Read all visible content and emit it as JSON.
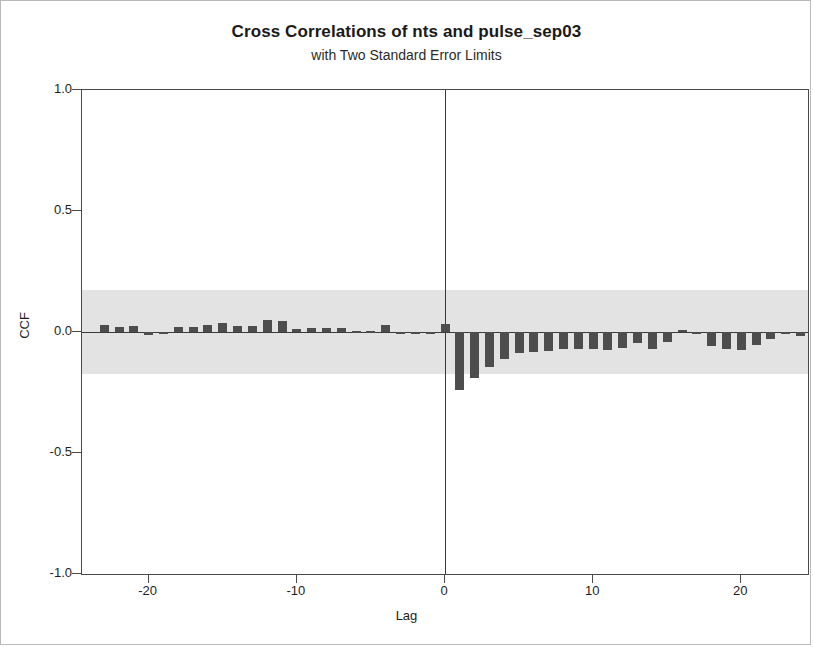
{
  "chart_data": {
    "type": "bar",
    "title": "Cross Correlations of nts and pulse_sep03",
    "subtitle": "with Two Standard Error Limits",
    "xlabel": "Lag",
    "ylabel": "CCF",
    "xlim": [
      -24.5,
      24.5
    ],
    "ylim": [
      -1.0,
      1.0
    ],
    "grid": false,
    "legend": null,
    "y_ticks": [
      "1.0",
      "0.5",
      "0.0",
      "-0.5",
      "-1.0"
    ],
    "y_tick_values": [
      1.0,
      0.5,
      0.0,
      -0.5,
      -1.0
    ],
    "x_ticks": [
      "-20",
      "-10",
      "0",
      "10",
      "20"
    ],
    "x_tick_values": [
      -20,
      -10,
      0,
      10,
      20
    ],
    "significance_band": {
      "label": "Two Standard Error Limits",
      "upper": 0.173,
      "lower": -0.173,
      "color": "#e3e3e3",
      "from_lag": -24,
      "to_lag": 24
    },
    "bar_color": "#4d4d4d",
    "categories": [
      -23,
      -22,
      -21,
      -20,
      -19,
      -18,
      -17,
      -16,
      -15,
      -14,
      -13,
      -12,
      -11,
      -10,
      -9,
      -8,
      -7,
      -6,
      -5,
      -4,
      -3,
      -2,
      -1,
      0,
      1,
      2,
      3,
      4,
      5,
      6,
      7,
      8,
      9,
      10,
      11,
      12,
      13,
      14,
      15,
      16,
      17,
      18,
      19,
      20,
      21,
      22,
      23,
      24
    ],
    "values": [
      0.03,
      0.022,
      0.025,
      -0.012,
      -0.008,
      0.02,
      0.022,
      0.03,
      0.038,
      0.026,
      0.024,
      0.048,
      0.044,
      0.014,
      0.017,
      0.016,
      0.018,
      0.006,
      0.004,
      0.03,
      -0.002,
      -0.002,
      -0.003,
      0.032,
      -0.24,
      -0.19,
      -0.145,
      -0.112,
      -0.085,
      -0.082,
      -0.078,
      -0.072,
      -0.07,
      -0.072,
      -0.074,
      -0.066,
      -0.046,
      -0.07,
      -0.04,
      0.01,
      -0.005,
      -0.056,
      -0.072,
      -0.076,
      -0.052,
      -0.03,
      -0.006,
      -0.018
    ]
  }
}
